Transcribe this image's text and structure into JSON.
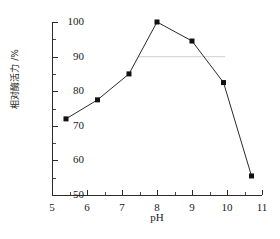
{
  "chart_data": {
    "type": "line",
    "title": "",
    "xlabel": "pH",
    "ylabel": "相对酶活力 /%",
    "xlim": [
      5,
      11
    ],
    "ylim": [
      50,
      100
    ],
    "grid": false,
    "legend": null,
    "x_ticks": [
      5,
      6,
      7,
      8,
      9,
      10,
      11
    ],
    "x_tick_labels": [
      "5",
      "6",
      "7",
      "8",
      "9",
      "10",
      "11"
    ],
    "x_minor_ticks": [
      5.5,
      6.5,
      7.5,
      8.5,
      9.5,
      10.5
    ],
    "y_ticks": [
      50,
      60,
      70,
      80,
      90,
      100
    ],
    "y_tick_labels": [
      "50",
      "60",
      "70",
      "80",
      "90",
      "100"
    ],
    "y_minor_ticks": [
      55,
      65,
      75,
      85,
      95
    ],
    "marker": "filled-square",
    "marker_color": "#111111",
    "line_color": "#2b2b2b",
    "x": [
      5.4,
      6.3,
      7.2,
      8.0,
      9.0,
      9.9,
      10.7
    ],
    "values": [
      72.0,
      77.5,
      85.0,
      100.0,
      94.5,
      82.5,
      55.5
    ],
    "annotations": [
      {
        "kind": "horizontal-guide-line",
        "y": 90.0,
        "x_start": 7.45,
        "x_end": 9.95,
        "color": "#d9d9d9"
      }
    ]
  },
  "axes": {
    "x_title": "pH",
    "y_title": "相对酶活力 /%"
  }
}
